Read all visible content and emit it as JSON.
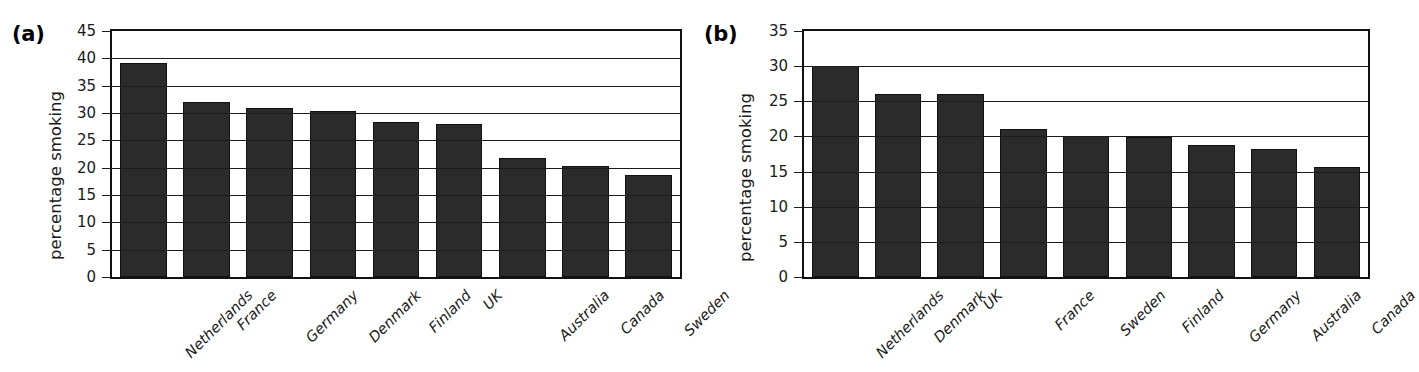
{
  "figure": {
    "background": "#ffffff",
    "bar_color": "#2b2b2b",
    "axis_color": "#111111"
  },
  "panels": [
    {
      "tag": "(a)",
      "ylabel": "percentage smoking"
    },
    {
      "tag": "(b)",
      "ylabel": "percentage smoking"
    }
  ],
  "chart_data": [
    {
      "type": "bar",
      "title": "(a)",
      "xlabel": "",
      "ylabel": "percentage smoking",
      "ylim": [
        0,
        45
      ],
      "ytick_step": 5,
      "yticks": [
        0,
        5,
        10,
        15,
        20,
        25,
        30,
        35,
        40,
        45
      ],
      "ytick_labels": [
        "0",
        "5",
        "10",
        "15",
        "20",
        "25",
        "30",
        "35",
        "40",
        "45"
      ],
      "grid": true,
      "legend": "none",
      "categories": [
        "Netherlands",
        "France",
        "Germany",
        "Denmark",
        "Finland",
        "UK",
        "Australia",
        "Canada",
        "Sweden"
      ],
      "values": [
        39.2,
        32.1,
        30.9,
        30.4,
        28.3,
        28.0,
        21.8,
        20.3,
        18.6
      ]
    },
    {
      "type": "bar",
      "title": "(b)",
      "xlabel": "",
      "ylabel": "percentage smoking",
      "ylim": [
        0,
        35
      ],
      "ytick_step": 5,
      "yticks": [
        0,
        5,
        10,
        15,
        20,
        25,
        30,
        35
      ],
      "ytick_labels": [
        "0",
        "5",
        "10",
        "15",
        "20",
        "25",
        "30",
        "35"
      ],
      "grid": true,
      "legend": "none",
      "categories": [
        "Netherlands",
        "Denmark",
        "UK",
        "France",
        "Sweden",
        "Finland",
        "Germany",
        "Australia",
        "Canada"
      ],
      "values": [
        30.0,
        26.1,
        26.0,
        21.0,
        20.0,
        19.9,
        18.8,
        18.2,
        15.7
      ]
    }
  ]
}
